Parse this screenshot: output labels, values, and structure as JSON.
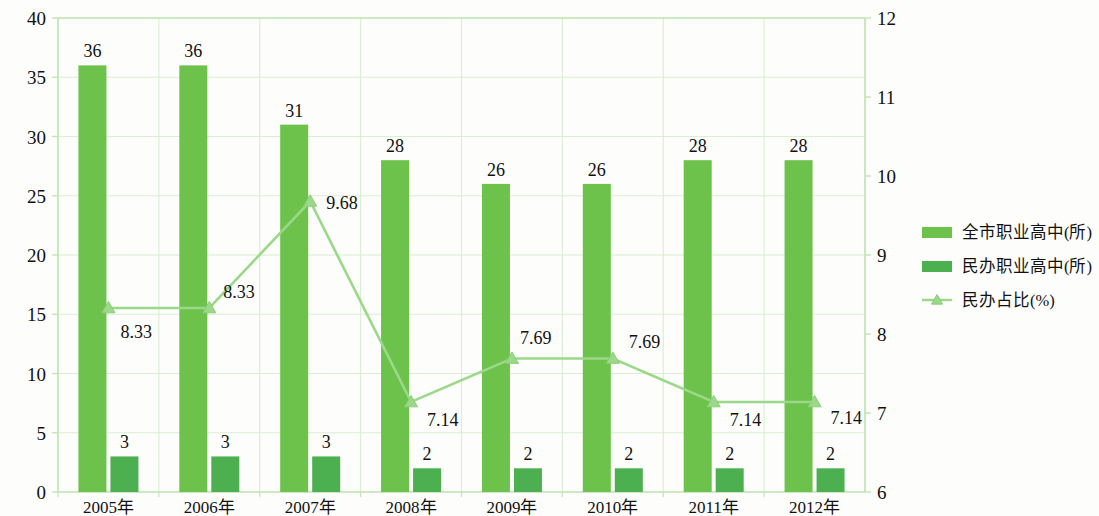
{
  "chart_data": {
    "type": "bar",
    "title": "",
    "subtitle": "",
    "xlabel": "",
    "ylabel": "",
    "categories": [
      "2005年",
      "2006年",
      "2007年",
      "2008年",
      "2009年",
      "2010年",
      "2011年",
      "2012年"
    ],
    "series": [
      {
        "name": "全市职业高中(所)",
        "type": "bar",
        "axis": "left",
        "color": "#6cc24a",
        "values": [
          36,
          36,
          31,
          28,
          26,
          26,
          28,
          28
        ]
      },
      {
        "name": "民办职业高中(所)",
        "type": "bar",
        "axis": "left",
        "color": "#4caf50",
        "values": [
          3,
          3,
          3,
          2,
          2,
          2,
          2,
          2
        ]
      },
      {
        "name": "民办占比(%)",
        "type": "line",
        "axis": "right",
        "color": "#9bd88a",
        "marker": "triangle",
        "values": [
          8.33,
          8.33,
          9.68,
          7.14,
          7.69,
          7.69,
          7.14,
          7.14
        ]
      }
    ],
    "left_axis": {
      "min": 0,
      "max": 40,
      "step": 5,
      "ticks": [
        "0",
        "5",
        "10",
        "15",
        "20",
        "25",
        "30",
        "35",
        "40"
      ]
    },
    "right_axis": {
      "min": 6,
      "max": 12,
      "step": 1,
      "ticks": [
        "6",
        "7",
        "8",
        "9",
        "10",
        "11",
        "12"
      ]
    },
    "grid": true,
    "legend_position": "right",
    "value_labels": {
      "total_bars": [
        "36",
        "36",
        "31",
        "28",
        "26",
        "26",
        "28",
        "28"
      ],
      "private_bars": [
        "3",
        "3",
        "3",
        "2",
        "2",
        "2",
        "2",
        "2"
      ],
      "line_points": [
        "8.33",
        "8.33",
        "9.68",
        "7.14",
        "7.69",
        "7.69",
        "7.14",
        "7.14"
      ]
    },
    "colors": {
      "bar_total": "#6cc24a",
      "bar_private": "#4caf50",
      "line": "#9bd88a",
      "grid": "#d9eed2",
      "axis": "#c3e4b6",
      "background": "#fdfdfb"
    }
  },
  "legend": {
    "items": [
      {
        "label": "全市职业高中(所)",
        "swatch": "#6cc24a",
        "kind": "bar"
      },
      {
        "label": "民办职业高中(所)",
        "swatch": "#4caf50",
        "kind": "bar"
      },
      {
        "label": "民办占比(%)",
        "swatch": "#9bd88a",
        "kind": "line"
      }
    ]
  }
}
